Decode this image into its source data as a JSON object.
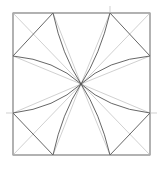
{
  "diagram": {
    "square": {
      "x1": 13,
      "y1": 13,
      "x2": 150,
      "y2": 155
    },
    "center": {
      "x": 81,
      "y": 84
    },
    "colors": {
      "dark_line": "#555555",
      "light_line": "#bbbbbb",
      "background": "#ffffff"
    }
  }
}
